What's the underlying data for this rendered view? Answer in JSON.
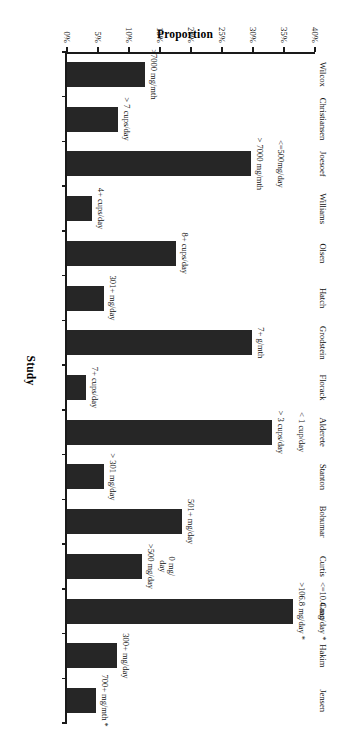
{
  "chart_data": {
    "type": "bar",
    "title": "",
    "xlabel": "Study",
    "ylabel": "Proportion",
    "ylim": [
      0,
      40
    ],
    "ytick_labels": [
      "0%",
      "5%",
      "10%",
      "15%",
      "20%",
      "25%",
      "30%",
      "35%",
      "40%"
    ],
    "ytick_values": [
      0,
      5,
      10,
      15,
      20,
      25,
      30,
      35,
      40
    ],
    "grid": false,
    "legend": null,
    "orientation": "vertical-bars-rotated-90",
    "categories": [
      "Wilcox",
      "Christiansen",
      "Joesoef",
      "Williams",
      "Olsen",
      "Hatch",
      "Grodstein",
      "Florack",
      "Alderete",
      "Stanton",
      "Bohumar",
      "Curtis",
      "Caan",
      "Hakim",
      "Jensen"
    ],
    "values": [
      12.6,
      8.3,
      29.6,
      4.0,
      17.6,
      6.0,
      29.9,
      3.1,
      33.0,
      6.0,
      18.6,
      12.1,
      36.5,
      8.1,
      4.6
    ],
    "point_labels": [
      ">7000 mg/mth",
      "> 7 cups/day",
      "> 7000 mg/mth",
      "4+ cups/day",
      "8+ cups/day",
      "301+ mg/day",
      "7+ g/mth",
      "7+ cups/day",
      "> 3 cups/day",
      "> 301 mg/day",
      "501+ mg/day",
      ">500 mg/day",
      ">106.8 mg/day *",
      "300+ mg/day",
      "700+ mg/mth *"
    ],
    "reference_labels": [
      {
        "category": "Joesoef",
        "text": "<=500mg/day"
      },
      {
        "category": "Alderete",
        "text": "< 1 cup/day"
      },
      {
        "category": "Curtis",
        "text": "0 mg/\nday"
      },
      {
        "category": "Caan",
        "text": "<=10.4 mg/day *"
      }
    ],
    "bar_color": "#262626",
    "axis_color": "#1a1a1a"
  },
  "axis": {
    "value_title": "Proportion",
    "category_title": "Study"
  }
}
